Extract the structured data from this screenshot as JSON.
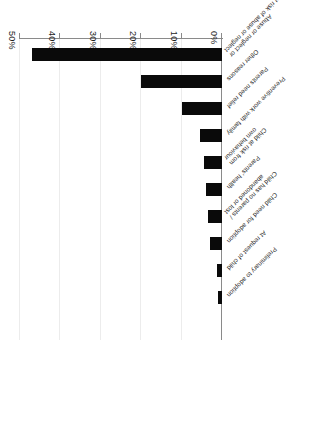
{
  "chart_data": {
    "type": "bar",
    "orientation": "horizontal",
    "title": "",
    "xlabel": "",
    "ylabel": "",
    "categories": [
      "Abuse or neglect or\nat risk of abuse or neglect",
      "Other reasons",
      "Parents need relief",
      "Preventive work with family",
      "Child at risk from\nown behaviour",
      "Parents' health",
      "Child has no parents /\nabandoned or lost",
      "Child need for adoption",
      "At request of child",
      "Preliminary to adoption"
    ],
    "values": [
      47,
      20,
      10,
      5.5,
      4.5,
      4,
      3.5,
      3,
      1.2,
      1
    ],
    "tick_labels": [
      "0%",
      "10%",
      "20%",
      "30%",
      "40%",
      "50%"
    ],
    "tick_values": [
      0,
      10,
      20,
      30,
      40,
      50
    ],
    "xlim": [
      0,
      50
    ],
    "grid": true,
    "legend": false,
    "bar_color": "#0a0a0a",
    "axis_color": "#8a8a8a",
    "rotation_note": "figure rendered upside-down (180 degrees) in source image"
  },
  "categories_display": [
    {
      "line1": "Abuse or neglect or",
      "line2": "at risk of abuse or neglect"
    },
    {
      "line1": "Other reasons",
      "line2": ""
    },
    {
      "line1": "Parents need relief",
      "line2": ""
    },
    {
      "line1": "Preventive work with family",
      "line2": ""
    },
    {
      "line1": "Child at risk from",
      "line2": "own behaviour"
    },
    {
      "line1": "Parents' health",
      "line2": ""
    },
    {
      "line1": "Child has no parents /",
      "line2": "abandoned or lost"
    },
    {
      "line1": "Child need for adoption",
      "line2": ""
    },
    {
      "line1": "At request of child",
      "line2": ""
    },
    {
      "line1": "Preliminary to adoption",
      "line2": ""
    }
  ],
  "axis": {
    "ticks": [
      "0%",
      "10%",
      "20%",
      "30%",
      "40%",
      "50%"
    ]
  }
}
